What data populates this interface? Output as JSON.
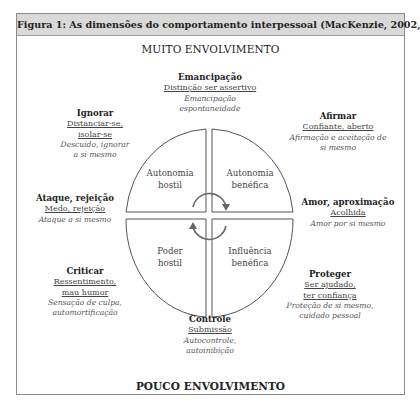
{
  "figure": {
    "title": "Figura 1: As dimensões do comportamento interpessoal (MacKenzie, 2002, p. 111)",
    "top_axis": "MUITO ENVOLVIMENTO",
    "bottom_axis": "POUCO ENVOLVIMENTO"
  },
  "quadrants": {
    "top_left": "Autonomia hostil",
    "top_right": "Autonomia benéfica",
    "bottom_left": "Poder hostil",
    "bottom_right": "Influência benéfica"
  },
  "groups": {
    "emancipacao": {
      "title": "Emancipação",
      "underlined": [
        "Distinção ser assertivo"
      ],
      "italic": [
        "Emancipação",
        "espontaneidade"
      ]
    },
    "ignorar": {
      "title": "Ignorar",
      "underlined": [
        "Distanciar-se,",
        "isolar-se"
      ],
      "italic": [
        "Descuido, ignorar",
        "a si mesmo"
      ]
    },
    "afirmar": {
      "title": "Afirmar",
      "underlined": [
        "Confiante, aberto"
      ],
      "italic": [
        "Afirmação e aceitação de",
        "si mesmo"
      ]
    },
    "ataque": {
      "title": "Ataque, rejeição",
      "underlined": [
        "Medo, rejeição"
      ],
      "italic": [
        "Ataque a si mesmo"
      ]
    },
    "amor": {
      "title": "Amor, aproximação",
      "underlined": [
        "Acolhida"
      ],
      "italic": [
        "Amor por si mesmo"
      ]
    },
    "criticar": {
      "title": "Criticar",
      "underlined": [
        "Ressentimento,",
        "mau humor"
      ],
      "italic": [
        "Sensação de culpa,",
        "automortificação"
      ]
    },
    "proteger": {
      "title": "Proteger",
      "underlined": [
        "Ser ajudado,",
        "ter confiança"
      ],
      "italic": [
        "Proteção de si mesmo,",
        "cuidado pessoal"
      ]
    },
    "controle": {
      "title": "Controle",
      "underlined": [
        "Submissão"
      ],
      "italic": [
        "Autocontrole,",
        "autoinibição"
      ]
    }
  },
  "colors": {
    "header_bg": "#d9d9d9",
    "line": "#555555",
    "border": "#8a8a8a"
  }
}
